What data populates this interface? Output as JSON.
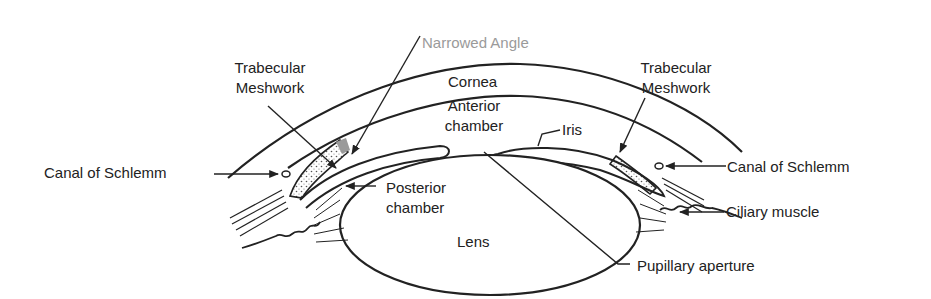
{
  "figure": {
    "colors": {
      "ink": "#222222",
      "highlight": "#9a9a9a",
      "background": "#ffffff"
    }
  },
  "labels": {
    "narrowed_angle": "Narrowed Angle",
    "trabecular_left_1": "Trabecular",
    "trabecular_left_2": "Meshwork",
    "trabecular_right_1": "Trabecular",
    "trabecular_right_2": "Meshwork",
    "cornea": "Cornea",
    "anterior_1": "Anterior",
    "anterior_2": "chamber",
    "iris": "Iris",
    "canal_left": "Canal of Schlemm",
    "canal_right": "Canal of Schlemm",
    "posterior_1": "Posterior",
    "posterior_2": "chamber",
    "ciliary": "Ciliary muscle",
    "lens": "Lens",
    "pupillary": "Pupillary aperture"
  }
}
